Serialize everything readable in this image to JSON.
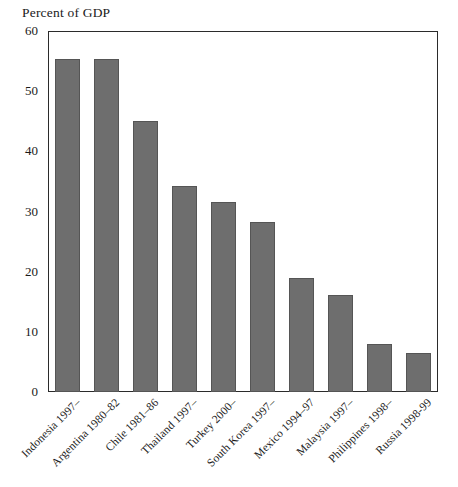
{
  "chart_data": {
    "type": "bar",
    "title": "Percent of GDP",
    "xlabel": "",
    "ylabel": "Percent of GDP",
    "ylim": [
      0,
      60
    ],
    "yticks": [
      0,
      10,
      20,
      30,
      40,
      50,
      60
    ],
    "grid": false,
    "legend": "none",
    "bar_color": "#6e6e6e",
    "categories": [
      "Indonesia 1997–",
      "Argentina 1980–82",
      "Chile 1981–86",
      "Thailand 1997–",
      "Turkey 2000–",
      "South Korea 1997–",
      "Mexico 1994–97",
      "Malaysia 1997–",
      "Philippines 1998–",
      "Russia 1998-99"
    ],
    "values": [
      55.3,
      55.3,
      45.0,
      34.2,
      31.5,
      28.2,
      19.0,
      16.2,
      7.9,
      6.5
    ]
  }
}
